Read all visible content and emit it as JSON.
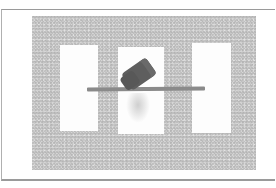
{
  "image": {
    "description": "Grayscale photograph of a dark block balanced on a horizontal stick above three white rectangular cards on a speckled gray surface",
    "colors": {
      "background_surface": "#d6d6d6",
      "cards": "#fdfdfd",
      "stick": "#8a8a8a",
      "block": "#5e5e5e",
      "frame": "#9a9a9a"
    },
    "objects": [
      {
        "name": "left-card"
      },
      {
        "name": "center-card"
      },
      {
        "name": "right-card"
      },
      {
        "name": "horizontal-stick"
      },
      {
        "name": "tilted-block"
      }
    ]
  }
}
